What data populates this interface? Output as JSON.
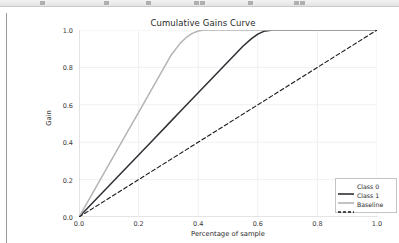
{
  "window": {
    "toolbar_name": "application-toolbar"
  },
  "chart_data": {
    "type": "line",
    "title": "Cumulative Gains Curve",
    "xlabel": "Percentage of sample",
    "ylabel": "Gain",
    "xlim": [
      0.0,
      1.0
    ],
    "ylim": [
      0.0,
      1.0
    ],
    "xticks": [
      "0.0",
      "0.2",
      "0.4",
      "0.6",
      "0.8",
      "1.0"
    ],
    "yticks": [
      "0.0",
      "0.2",
      "0.4",
      "0.6",
      "0.8",
      "1.0"
    ],
    "xtick_values": [
      0.0,
      0.2,
      0.4,
      0.6,
      0.8,
      1.0
    ],
    "ytick_values": [
      0.0,
      0.2,
      0.4,
      0.6,
      0.8,
      1.0
    ],
    "grid": true,
    "legend_position": "lower right",
    "series": [
      {
        "name": "Class 0",
        "color": "#2f2f35",
        "style": "solid",
        "width": 1.5,
        "x": [
          0.0,
          0.05,
          0.1,
          0.15,
          0.2,
          0.25,
          0.3,
          0.35,
          0.4,
          0.45,
          0.5,
          0.55,
          0.58,
          0.6,
          0.62,
          0.65,
          0.7,
          0.8,
          0.9,
          1.0
        ],
        "y": [
          0.0,
          0.083,
          0.166,
          0.249,
          0.332,
          0.415,
          0.498,
          0.581,
          0.664,
          0.747,
          0.83,
          0.913,
          0.955,
          0.978,
          0.993,
          1.0,
          1.0,
          1.0,
          1.0,
          1.0
        ]
      },
      {
        "name": "Class 1",
        "color": "#b4b4b4",
        "style": "solid",
        "width": 1.5,
        "x": [
          0.0,
          0.04,
          0.08,
          0.12,
          0.16,
          0.2,
          0.24,
          0.28,
          0.31,
          0.34,
          0.36,
          0.38,
          0.4,
          0.42,
          0.45,
          0.5,
          0.6,
          0.7,
          0.8,
          0.9,
          1.0
        ],
        "y": [
          0.0,
          0.112,
          0.224,
          0.336,
          0.448,
          0.56,
          0.672,
          0.784,
          0.868,
          0.93,
          0.96,
          0.982,
          0.995,
          1.0,
          1.0,
          1.0,
          1.0,
          1.0,
          1.0,
          1.0,
          1.0
        ]
      },
      {
        "name": "Baseline",
        "color": "#1a1a1a",
        "style": "dashed",
        "width": 1.1,
        "x": [
          0.0,
          1.0
        ],
        "y": [
          0.0,
          1.0
        ]
      }
    ]
  },
  "legend": {
    "items": [
      {
        "label": "Class 0",
        "color": "#2f2f35",
        "style": "solid"
      },
      {
        "label": "Class 1",
        "color": "#b4b4b4",
        "style": "solid"
      },
      {
        "label": "Baseline",
        "color": "#1a1a1a",
        "style": "dashed"
      }
    ]
  },
  "colors": {
    "class_0": "#2f2f35",
    "class_1": "#b4b4b4",
    "baseline": "#1a1a1a",
    "grid": "#f0f0f2",
    "axis": "#d0d0d0"
  }
}
